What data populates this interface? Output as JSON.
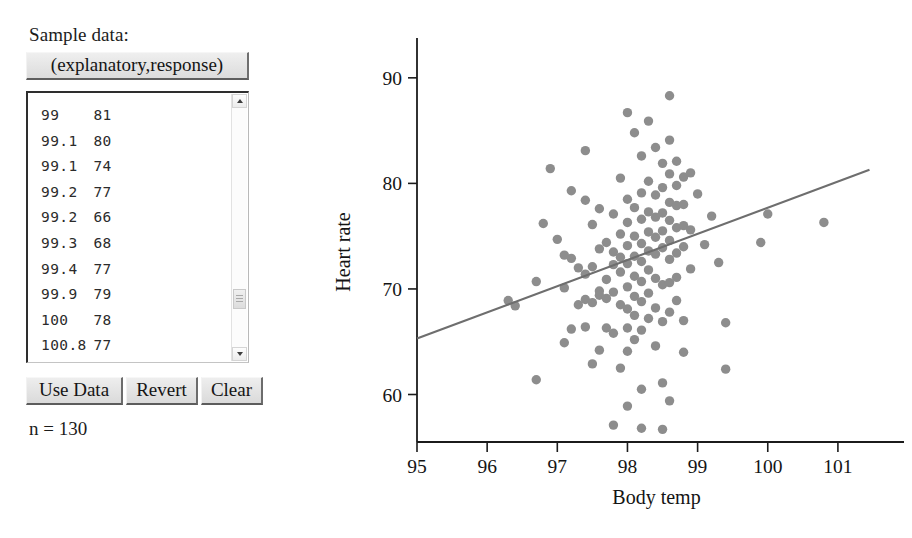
{
  "panel": {
    "sample_data_label": "Sample data:",
    "header_button_label": "(explanatory,response)",
    "n_label": "n = 130",
    "buttons": [
      {
        "name": "use-data",
        "label": "Use Data"
      },
      {
        "name": "revert",
        "label": "Revert"
      },
      {
        "name": "clear",
        "label": "Clear"
      }
    ],
    "visible_rows": [
      {
        "x": "99",
        "y": "81"
      },
      {
        "x": "99.1",
        "y": "80"
      },
      {
        "x": "99.1",
        "y": "74"
      },
      {
        "x": "99.2",
        "y": "77"
      },
      {
        "x": "99.2",
        "y": "66"
      },
      {
        "x": "99.3",
        "y": "68"
      },
      {
        "x": "99.4",
        "y": "77"
      },
      {
        "x": "99.9",
        "y": "79"
      },
      {
        "x": "100",
        "y": "78"
      },
      {
        "x": "100.8",
        "y": "77"
      }
    ],
    "scrollbar": {
      "up_arrow": "scroll-up",
      "down_arrow": "scroll-down",
      "thumb": "scroll-thumb"
    }
  },
  "chart_data": {
    "type": "scatter",
    "title": "",
    "xlabel": "Body temp",
    "ylabel": "Heart rate",
    "xlim": [
      95,
      101.6
    ],
    "ylim": [
      55.5,
      91.5
    ],
    "xticks": [
      95,
      96,
      97,
      98,
      99,
      100,
      101
    ],
    "yticks": [
      60,
      70,
      80,
      90
    ],
    "grid": false,
    "legend": null,
    "n": 130,
    "point_color": "#8d8d8d",
    "point_radius": 4.7,
    "line_color": "#6e6e6e",
    "trendline": {
      "type": "linear-regression",
      "x_start": 95.0,
      "y_start": 65.3,
      "x_end": 101.45,
      "y_end": 81.3
    },
    "points": [
      [
        96.3,
        68.9
      ],
      [
        96.4,
        68.4
      ],
      [
        96.7,
        61.4
      ],
      [
        96.7,
        70.7
      ],
      [
        96.8,
        76.2
      ],
      [
        96.9,
        81.4
      ],
      [
        97.0,
        74.7
      ],
      [
        97.1,
        73.2
      ],
      [
        97.1,
        70.1
      ],
      [
        97.1,
        64.9
      ],
      [
        97.2,
        79.3
      ],
      [
        97.2,
        72.9
      ],
      [
        97.2,
        66.2
      ],
      [
        97.3,
        68.5
      ],
      [
        97.3,
        72.0
      ],
      [
        97.4,
        83.1
      ],
      [
        97.4,
        78.4
      ],
      [
        97.4,
        71.4
      ],
      [
        97.4,
        69.0
      ],
      [
        97.4,
        66.4
      ],
      [
        97.5,
        76.1
      ],
      [
        97.5,
        72.1
      ],
      [
        97.5,
        68.7
      ],
      [
        97.5,
        62.9
      ],
      [
        97.6,
        77.6
      ],
      [
        97.6,
        73.8
      ],
      [
        97.6,
        69.8
      ],
      [
        97.6,
        69.4
      ],
      [
        97.6,
        64.2
      ],
      [
        97.7,
        74.4
      ],
      [
        97.7,
        70.9
      ],
      [
        97.7,
        69.1
      ],
      [
        97.7,
        66.3
      ],
      [
        97.8,
        77.1
      ],
      [
        97.8,
        73.5
      ],
      [
        97.8,
        72.3
      ],
      [
        97.8,
        69.7
      ],
      [
        97.8,
        65.8
      ],
      [
        97.8,
        57.1
      ],
      [
        97.9,
        80.5
      ],
      [
        97.9,
        75.2
      ],
      [
        97.9,
        73.0
      ],
      [
        97.9,
        71.6
      ],
      [
        97.9,
        68.5
      ],
      [
        97.9,
        62.5
      ],
      [
        98.0,
        86.7
      ],
      [
        98.0,
        78.5
      ],
      [
        98.0,
        76.3
      ],
      [
        98.0,
        74.1
      ],
      [
        98.0,
        72.4
      ],
      [
        98.0,
        70.2
      ],
      [
        98.0,
        68.1
      ],
      [
        98.0,
        66.3
      ],
      [
        98.0,
        64.1
      ],
      [
        98.0,
        58.9
      ],
      [
        98.1,
        84.8
      ],
      [
        98.1,
        77.7
      ],
      [
        98.1,
        75.0
      ],
      [
        98.1,
        73.1
      ],
      [
        98.1,
        71.2
      ],
      [
        98.1,
        69.3
      ],
      [
        98.1,
        67.5
      ],
      [
        98.1,
        65.2
      ],
      [
        98.2,
        82.6
      ],
      [
        98.2,
        79.1
      ],
      [
        98.2,
        76.6
      ],
      [
        98.2,
        74.3
      ],
      [
        98.2,
        72.6
      ],
      [
        98.2,
        70.7
      ],
      [
        98.2,
        68.8
      ],
      [
        98.2,
        66.1
      ],
      [
        98.2,
        60.5
      ],
      [
        98.2,
        56.8
      ],
      [
        98.3,
        85.9
      ],
      [
        98.3,
        80.2
      ],
      [
        98.3,
        77.3
      ],
      [
        98.3,
        75.4
      ],
      [
        98.3,
        73.6
      ],
      [
        98.3,
        71.8
      ],
      [
        98.3,
        69.6
      ],
      [
        98.3,
        67.2
      ],
      [
        98.4,
        83.4
      ],
      [
        98.4,
        78.9
      ],
      [
        98.4,
        76.8
      ],
      [
        98.4,
        74.9
      ],
      [
        98.4,
        73.3
      ],
      [
        98.4,
        71.0
      ],
      [
        98.4,
        68.2
      ],
      [
        98.4,
        64.6
      ],
      [
        98.5,
        81.9
      ],
      [
        98.5,
        79.6
      ],
      [
        98.5,
        77.2
      ],
      [
        98.5,
        75.5
      ],
      [
        98.5,
        73.9
      ],
      [
        98.5,
        70.4
      ],
      [
        98.5,
        66.9
      ],
      [
        98.5,
        61.1
      ],
      [
        98.5,
        56.7
      ],
      [
        98.6,
        88.3
      ],
      [
        98.6,
        84.1
      ],
      [
        98.6,
        80.9
      ],
      [
        98.6,
        78.2
      ],
      [
        98.6,
        76.5
      ],
      [
        98.6,
        74.6
      ],
      [
        98.6,
        72.8
      ],
      [
        98.6,
        70.6
      ],
      [
        98.6,
        67.8
      ],
      [
        98.6,
        59.4
      ],
      [
        98.7,
        82.1
      ],
      [
        98.7,
        79.8
      ],
      [
        98.7,
        77.9
      ],
      [
        98.7,
        75.8
      ],
      [
        98.7,
        73.4
      ],
      [
        98.7,
        71.1
      ],
      [
        98.7,
        68.9
      ],
      [
        98.8,
        80.6
      ],
      [
        98.8,
        78.0
      ],
      [
        98.8,
        76.0
      ],
      [
        98.8,
        74.0
      ],
      [
        98.8,
        67.0
      ],
      [
        98.8,
        64.0
      ],
      [
        98.9,
        81.0
      ],
      [
        98.9,
        75.6
      ],
      [
        98.9,
        71.9
      ],
      [
        99.0,
        79.0
      ],
      [
        99.1,
        74.2
      ],
      [
        99.2,
        76.9
      ],
      [
        99.3,
        72.5
      ],
      [
        99.4,
        66.8
      ],
      [
        99.4,
        62.4
      ],
      [
        99.9,
        74.4
      ],
      [
        100.0,
        77.1
      ],
      [
        100.8,
        76.3
      ]
    ]
  }
}
